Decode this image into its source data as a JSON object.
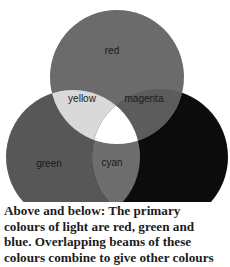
{
  "figure": {
    "circles": {
      "red": {
        "label": "red",
        "color": "#6b6b6b"
      },
      "green": {
        "label": "green",
        "color": "#575757"
      },
      "blue": {
        "label": "blue",
        "color": "#0c0c0c"
      }
    },
    "overlaps": {
      "yellow": {
        "label": "yellow",
        "color": "#d9d9d9"
      },
      "magenta": {
        "label": "magenta",
        "color": "#5c5c5c"
      },
      "cyan": {
        "label": "cyan",
        "color": "#6e6e6e"
      },
      "white": {
        "color": "#ffffff"
      }
    }
  },
  "caption": {
    "lines": [
      "Above and below: The primary",
      "colours of light are red, green and",
      "blue. Overlapping beams of these",
      "colours combine to give other colours"
    ]
  }
}
